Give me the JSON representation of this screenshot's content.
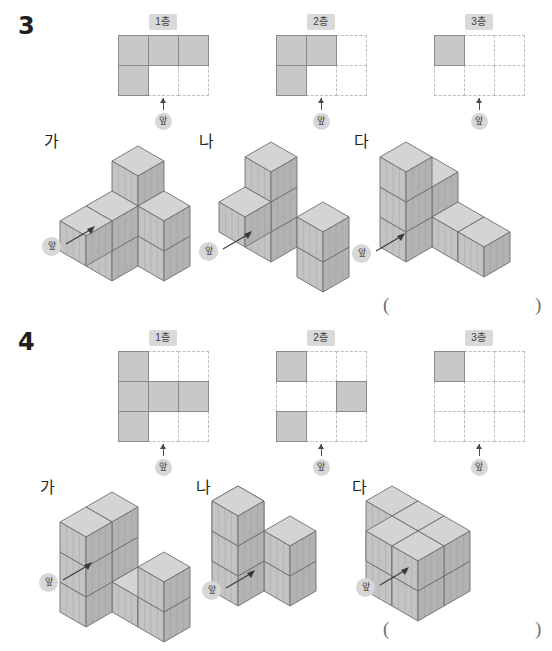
{
  "page": {
    "problems": [
      {
        "number": "3",
        "layers": [
          {
            "tag": "1층",
            "cols": 3,
            "rows": 2,
            "cells": [
              [
                1,
                1,
                1
              ],
              [
                1,
                0,
                0
              ]
            ],
            "front_label": "앞"
          },
          {
            "tag": "2층",
            "cols": 3,
            "rows": 2,
            "cells": [
              [
                1,
                1,
                0
              ],
              [
                1,
                0,
                0
              ]
            ],
            "front_label": "앞"
          },
          {
            "tag": "3층",
            "cols": 3,
            "rows": 2,
            "cells": [
              [
                1,
                0,
                0
              ],
              [
                0,
                0,
                0
              ]
            ],
            "front_label": "앞"
          }
        ],
        "figures": [
          {
            "label": "가",
            "front_label": "앞"
          },
          {
            "label": "나",
            "front_label": "앞"
          },
          {
            "label": "다",
            "front_label": "앞"
          }
        ],
        "answer": {
          "left_paren": "(",
          "right_paren": ")"
        }
      },
      {
        "number": "4",
        "layers": [
          {
            "tag": "1층",
            "cols": 3,
            "rows": 3,
            "cells": [
              [
                1,
                0,
                0
              ],
              [
                1,
                1,
                1
              ],
              [
                1,
                0,
                0
              ]
            ],
            "front_label": "앞"
          },
          {
            "tag": "2층",
            "cols": 3,
            "rows": 3,
            "cells": [
              [
                1,
                0,
                0
              ],
              [
                0,
                0,
                1
              ],
              [
                1,
                0,
                0
              ]
            ],
            "front_label": "앞"
          },
          {
            "tag": "3층",
            "cols": 3,
            "rows": 3,
            "cells": [
              [
                1,
                0,
                0
              ],
              [
                0,
                0,
                0
              ],
              [
                0,
                0,
                0
              ]
            ],
            "front_label": "앞"
          }
        ],
        "figures": [
          {
            "label": "가",
            "front_label": "앞"
          },
          {
            "label": "나",
            "front_label": "앞"
          },
          {
            "label": "다",
            "front_label": "앞"
          }
        ],
        "answer": {
          "left_paren": "(",
          "right_paren": ")"
        }
      }
    ]
  },
  "cube_shapes": {
    "p3_ga": [
      [
        0,
        0,
        0
      ],
      [
        0,
        1,
        0
      ],
      [
        1,
        0,
        0
      ],
      [
        0,
        0,
        1
      ],
      [
        1,
        0,
        1
      ],
      [
        0,
        1,
        1
      ],
      [
        0,
        2,
        1
      ],
      [
        0,
        0,
        2
      ]
    ],
    "p3_na": [
      [
        0,
        0,
        0
      ],
      [
        0,
        0,
        1
      ],
      [
        0,
        0,
        2
      ],
      [
        0,
        1,
        1
      ],
      [
        2,
        0,
        0
      ],
      [
        2,
        0,
        1
      ]
    ],
    "p3_da": [
      [
        0,
        0,
        0
      ],
      [
        0,
        0,
        1
      ],
      [
        1,
        0,
        0
      ],
      [
        0,
        1,
        0
      ],
      [
        0,
        1,
        1
      ],
      [
        0,
        1,
        2
      ],
      [
        2,
        0,
        0
      ]
    ],
    "p4_ga": [
      [
        0,
        0,
        0
      ],
      [
        0,
        0,
        1
      ],
      [
        0,
        0,
        2
      ],
      [
        1,
        0,
        0
      ],
      [
        2,
        0,
        0
      ],
      [
        2,
        0,
        1
      ],
      [
        0,
        1,
        0
      ],
      [
        0,
        1,
        1
      ],
      [
        0,
        1,
        2
      ]
    ],
    "p4_na": [
      [
        0,
        0,
        0
      ],
      [
        0,
        0,
        1
      ],
      [
        1,
        0,
        0
      ],
      [
        2,
        0,
        0
      ],
      [
        2,
        0,
        1
      ],
      [
        1,
        1,
        0
      ],
      [
        1,
        1,
        1
      ],
      [
        1,
        1,
        2
      ]
    ],
    "p4_da": [
      [
        0,
        0,
        0
      ],
      [
        0,
        0,
        1
      ],
      [
        1,
        0,
        0
      ],
      [
        1,
        0,
        1
      ],
      [
        2,
        0,
        0
      ],
      [
        2,
        0,
        1
      ],
      [
        1,
        1,
        0
      ],
      [
        1,
        1,
        1
      ],
      [
        2,
        1,
        0
      ],
      [
        2,
        1,
        1
      ]
    ]
  },
  "colors": {
    "cube_top": "#d4d4d4",
    "cube_left": "#c3c3c3",
    "cube_right": "#b2b2b2",
    "cube_edge": "#6f6f6f",
    "grid_fill": "#c8c8c8",
    "grid_dash": "#bdbdbd",
    "tag_bg": "#d9d9d9",
    "badge_bg": "#d7d7d7",
    "ink": "#231f20"
  }
}
